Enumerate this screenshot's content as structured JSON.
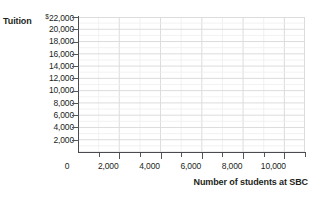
{
  "chart_data": {
    "type": "scatter",
    "title": "",
    "subtitle": "",
    "xlabel": "Number of students at SBC",
    "ylabel": "Tuition",
    "grid": true,
    "legend": null,
    "series": [],
    "x": [],
    "values": [],
    "note": "Blank grid template; no data plotted.",
    "xlim": [
      0,
      11000
    ],
    "ylim": [
      0,
      22000
    ],
    "x_major_step": 2000,
    "x_minor_step": 1000,
    "y_major_step": 2000,
    "x_tick_labels": [
      "0",
      "2,000",
      "4,000",
      "6,000",
      "8,000",
      "10,000"
    ],
    "x_tick_values": [
      0,
      2000,
      4000,
      6000,
      8000,
      10000
    ],
    "y_tick_labels": [
      {
        "currency": "$",
        "value": "22,000"
      },
      {
        "currency": "",
        "value": "20,000"
      },
      {
        "currency": "",
        "value": "18,000"
      },
      {
        "currency": "",
        "value": "16,000"
      },
      {
        "currency": "",
        "value": "14,000"
      },
      {
        "currency": "",
        "value": "12,000"
      },
      {
        "currency": "",
        "value": "10,000"
      },
      {
        "currency": "",
        "value": "8,000"
      },
      {
        "currency": "",
        "value": "6,000"
      },
      {
        "currency": "",
        "value": "4,000"
      },
      {
        "currency": "",
        "value": "2,000"
      }
    ],
    "y_tick_values": [
      22000,
      20000,
      18000,
      16000,
      14000,
      12000,
      10000,
      8000,
      6000,
      4000,
      2000
    ],
    "colors": {
      "axis": "#4b4b4f",
      "tick": "#53565a",
      "grid_minor": "#ececed",
      "grid_major": "#dcdcde",
      "text": "#231f20",
      "background": "#ffffff"
    }
  }
}
